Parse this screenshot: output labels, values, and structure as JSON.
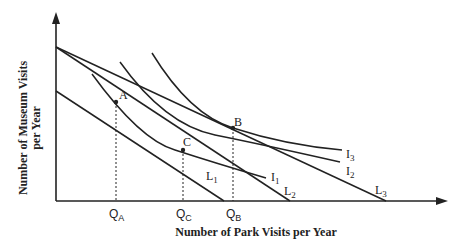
{
  "diagram": {
    "type": "indifference-curve-budget-line",
    "x_axis_label": "Number of Park Visits per Year",
    "y_axis_label_line1": "Number of Museum Visits",
    "y_axis_label_line2": "per Year",
    "points": {
      "A": "A",
      "B": "B",
      "C": "C"
    },
    "quantities": {
      "QA": {
        "main": "Q",
        "sub": "A"
      },
      "QC": {
        "main": "Q",
        "sub": "C"
      },
      "QB": {
        "main": "Q",
        "sub": "B"
      }
    },
    "indifference_curves": [
      {
        "main": "I",
        "sub": "1"
      },
      {
        "main": "I",
        "sub": "2"
      },
      {
        "main": "I",
        "sub": "3"
      }
    ],
    "budget_lines": [
      {
        "main": "L",
        "sub": "1"
      },
      {
        "main": "L",
        "sub": "2"
      },
      {
        "main": "L",
        "sub": "3"
      }
    ],
    "line_color": "#222222"
  }
}
